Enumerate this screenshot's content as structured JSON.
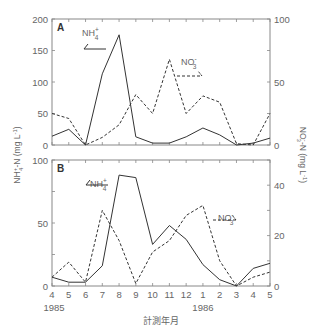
{
  "chart_data": {
    "type": "line",
    "xlabel": "計測年月",
    "x_ticks": [
      "4",
      "5",
      "6",
      "7",
      "8",
      "9",
      "10",
      "11",
      "12",
      "1",
      "2",
      "3",
      "4",
      "5"
    ],
    "year_labels": [
      {
        "label": "1985",
        "at_index": 0
      },
      {
        "label": "1986",
        "at_index": 9
      }
    ],
    "ylabel_left": "NH4+-N (mg L-1)",
    "ylabel_right": "NO3--N (mg L-1)",
    "panels": [
      {
        "label": "A",
        "ylim_left": [
          0,
          200
        ],
        "yticks_left": [
          0,
          50,
          100,
          150,
          200
        ],
        "ylim_right": [
          0,
          100
        ],
        "yticks_right": [
          0,
          50,
          100
        ],
        "series": [
          {
            "name": "NH4+",
            "axis": "left",
            "style": "solid",
            "values": [
              14,
              25,
              0,
              113,
              175,
              13,
              3,
              3,
              13,
              27,
              16,
              0,
              3,
              11
            ]
          },
          {
            "name": "NO3-",
            "axis": "right",
            "style": "dashed",
            "values": [
              25,
              21,
              0,
              6,
              16,
              40,
              25,
              68,
              25,
              39,
              34,
              1,
              0,
              25
            ]
          }
        ],
        "legend": [
          {
            "name": "NH4+",
            "text": "NH",
            "sub": "4",
            "sup": "+",
            "style": "solid"
          },
          {
            "name": "NO3-",
            "text": "NO",
            "sub": "3",
            "sup": "-",
            "style": "dashed"
          }
        ]
      },
      {
        "label": "B",
        "ylim_left": [
          0,
          100
        ],
        "yticks_left": [
          0,
          50,
          100
        ],
        "ylim_right": [
          0,
          50
        ],
        "yticks_right": [
          0,
          20,
          40
        ],
        "series": [
          {
            "name": "NH4+",
            "axis": "left",
            "style": "solid",
            "values": [
              7,
              3,
              3,
              16,
              88,
              86,
              33,
              48,
              37,
              17,
              5,
              0,
              14,
              18
            ]
          },
          {
            "name": "NO3-",
            "axis": "right",
            "style": "dashed",
            "values": [
              3.5,
              9.5,
              1.5,
              30,
              18,
              1,
              13.5,
              18,
              28,
              32,
              10,
              0,
              3.5,
              5.5
            ]
          }
        ],
        "legend": [
          {
            "name": "NH4+",
            "text": "NH",
            "sub": "4",
            "sup": "+",
            "style": "solid"
          },
          {
            "name": "NO3-",
            "text": "NO",
            "sub": "3",
            "sup": "-",
            "style": "dashed"
          }
        ]
      }
    ]
  },
  "colors": {
    "line": "#333333",
    "axis": "#888888",
    "text": "#666666"
  }
}
